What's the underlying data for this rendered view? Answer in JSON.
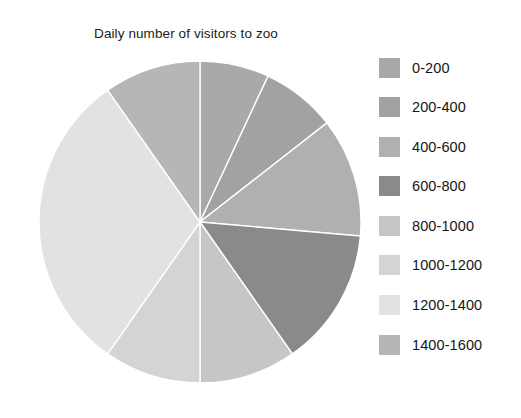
{
  "chart_data": {
    "type": "pie",
    "title": "Daily number of visitors to zoo",
    "xlabel": "",
    "ylabel": "",
    "legend_position": "right",
    "grid": false,
    "categories": [
      "0-200",
      "200-400",
      "400-600",
      "600-800",
      "800-1000",
      "1000-1200",
      "1200-1400",
      "1400-1600"
    ],
    "values": [
      25,
      27,
      43,
      50,
      35,
      35,
      110,
      35
    ],
    "unit": "degrees",
    "percentages": [
      6.9,
      7.5,
      11.9,
      13.9,
      9.7,
      9.7,
      30.6,
      9.7
    ],
    "colors": [
      "#a9a9a9",
      "#a2a2a2",
      "#b0b0b0",
      "#8a8a8a",
      "#c6c6c6",
      "#d4d4d4",
      "#e2e2e2",
      "#b6b6b6"
    ],
    "slice_separator_color": "#ffffff",
    "start_angle_deg": 0,
    "direction": "clockwise"
  },
  "legend": {
    "items": [
      {
        "label": "0-200",
        "color": "#a9a9a9"
      },
      {
        "label": "200-400",
        "color": "#a2a2a2"
      },
      {
        "label": "400-600",
        "color": "#b0b0b0"
      },
      {
        "label": "600-800",
        "color": "#8a8a8a"
      },
      {
        "label": "800-1000",
        "color": "#c6c6c6"
      },
      {
        "label": "1000-1200",
        "color": "#d4d4d4"
      },
      {
        "label": "1200-1400",
        "color": "#e2e2e2"
      },
      {
        "label": "1400-1600",
        "color": "#b6b6b6"
      }
    ]
  },
  "figure": {
    "background": "#ffffff",
    "title_color": "#1c1c1c"
  }
}
